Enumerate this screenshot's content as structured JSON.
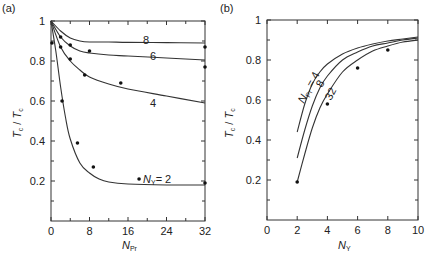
{
  "chart_data": [
    {
      "panel": "(a)",
      "type": "line",
      "xlabel": "N_Pr",
      "ylabel": "T'c / Tc",
      "xlim": [
        0,
        32
      ],
      "ylim": [
        0,
        1
      ],
      "xticks": [
        "0",
        "8",
        "16",
        "24",
        "32"
      ],
      "yticks": [
        "0.2",
        "0.4",
        "0.6",
        "0.8",
        "1"
      ],
      "series": [
        {
          "name": "8",
          "x": [
            0,
            2,
            4,
            6,
            8,
            12,
            16,
            24,
            32
          ],
          "y": [
            1.0,
            0.95,
            0.915,
            0.9,
            0.895,
            0.895,
            0.893,
            0.892,
            0.89
          ]
        },
        {
          "name": "6",
          "x": [
            0,
            2,
            4,
            6,
            8,
            12,
            16,
            24,
            32
          ],
          "y": [
            1.0,
            0.92,
            0.875,
            0.85,
            0.84,
            0.83,
            0.825,
            0.815,
            0.805
          ]
        },
        {
          "name": "4",
          "x": [
            0,
            2,
            4,
            6,
            8,
            12,
            16,
            24,
            32
          ],
          "y": [
            1.0,
            0.87,
            0.8,
            0.755,
            0.72,
            0.685,
            0.66,
            0.625,
            0.59
          ]
        },
        {
          "name": "N_Y = 2",
          "x": [
            0,
            1,
            2,
            3,
            4,
            6,
            8,
            10,
            12,
            16,
            24,
            32
          ],
          "y": [
            1.0,
            0.85,
            0.67,
            0.52,
            0.41,
            0.29,
            0.24,
            0.21,
            0.195,
            0.185,
            0.18,
            0.18
          ]
        }
      ],
      "points": [
        {
          "x": 0.2,
          "y": 0.89
        },
        {
          "x": 2,
          "y": 0.92
        },
        {
          "x": 2,
          "y": 0.87
        },
        {
          "x": 4,
          "y": 0.88
        },
        {
          "x": 4,
          "y": 0.81
        },
        {
          "x": 8,
          "y": 0.85
        },
        {
          "x": 7,
          "y": 0.73
        },
        {
          "x": 14.5,
          "y": 0.69
        },
        {
          "x": 2.3,
          "y": 0.6
        },
        {
          "x": 5.5,
          "y": 0.39
        },
        {
          "x": 8.8,
          "y": 0.27
        },
        {
          "x": 18.3,
          "y": 0.21
        },
        {
          "x": 32,
          "y": 0.87
        },
        {
          "x": 32,
          "y": 0.77
        },
        {
          "x": 32,
          "y": 0.19
        }
      ]
    },
    {
      "panel": "(b)",
      "type": "line",
      "xlabel": "N_Y",
      "ylabel": "T'c / Tc",
      "xlim": [
        0,
        10
      ],
      "ylim": [
        0,
        1
      ],
      "xticks": [
        "0",
        "2",
        "4",
        "6",
        "8",
        "10"
      ],
      "yticks": [
        "0.2",
        "0.4",
        "0.6",
        "0.8",
        "1"
      ],
      "series": [
        {
          "name": "N_Pr = 4",
          "x": [
            2,
            2.5,
            3,
            3.5,
            4,
            5,
            6,
            7,
            8,
            9,
            10
          ],
          "y": [
            0.44,
            0.58,
            0.68,
            0.74,
            0.78,
            0.83,
            0.86,
            0.88,
            0.895,
            0.905,
            0.915
          ]
        },
        {
          "name": "8",
          "x": [
            2,
            2.5,
            3,
            3.5,
            4,
            5,
            6,
            7,
            8,
            9,
            10
          ],
          "y": [
            0.31,
            0.45,
            0.57,
            0.66,
            0.72,
            0.8,
            0.84,
            0.87,
            0.885,
            0.9,
            0.91
          ]
        },
        {
          "name": "32",
          "x": [
            2,
            2.5,
            3,
            3.5,
            4,
            5,
            6,
            7,
            8,
            9,
            10
          ],
          "y": [
            0.19,
            0.33,
            0.46,
            0.56,
            0.63,
            0.74,
            0.8,
            0.845,
            0.87,
            0.89,
            0.9
          ]
        }
      ],
      "points": [
        {
          "x": 2,
          "y": 0.19
        },
        {
          "x": 4,
          "y": 0.58
        },
        {
          "x": 6,
          "y": 0.76
        },
        {
          "x": 8,
          "y": 0.85
        }
      ]
    }
  ],
  "labels": {
    "panel_a": "(a)",
    "panel_b": "(b)",
    "a_curve_8": "8",
    "a_curve_6": "6",
    "a_curve_4": "4",
    "a_curve_2_prefix": "N",
    "a_curve_2_sub": "Y",
    "a_curve_2_suffix": "= 2",
    "b_curve_4_prefix": "N",
    "b_curve_4_sub": "Pr",
    "b_curve_4_suffix": " = 4",
    "b_curve_8": "8",
    "b_curve_32": "32",
    "y_label_main": "T",
    "y_label_sub": "c",
    "x_a_main": "N",
    "x_a_sub": "Pr",
    "x_b_main": "N",
    "x_b_sub": "Y"
  }
}
